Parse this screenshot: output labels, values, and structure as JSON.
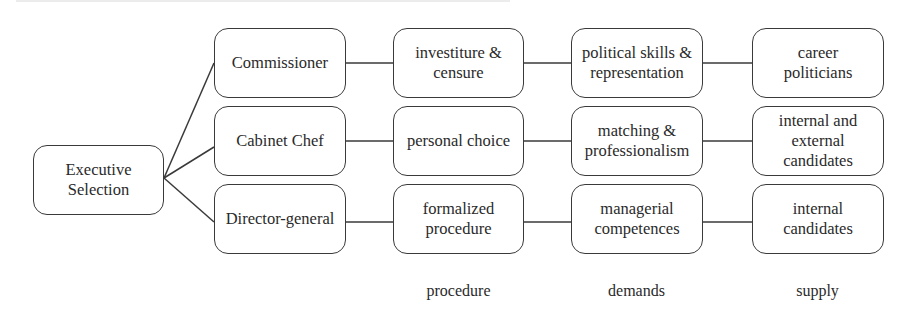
{
  "root": {
    "label": "Executive\nSelection"
  },
  "rows": [
    {
      "role": "Commissioner",
      "procedure": "investiture &\ncensure",
      "demands": "political skills &\nrepresentation",
      "supply": "career\npoliticians"
    },
    {
      "role": "Cabinet Chef",
      "procedure": "personal choice",
      "demands": "matching &\nprofessionalism",
      "supply": "internal and\nexternal\ncandidates"
    },
    {
      "role": "Director-general",
      "procedure": "formalized\nprocedure",
      "demands": "managerial\ncompetences",
      "supply": "internal\ncandidates"
    }
  ],
  "column_labels": {
    "procedure": "procedure",
    "demands": "demands",
    "supply": "supply"
  }
}
